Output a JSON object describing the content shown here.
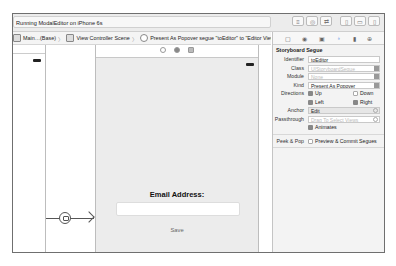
{
  "toolbar": {
    "run_status": "Running ModalEditor on iPhone 6s",
    "icons": [
      "editor-standard-icon",
      "assistant-editor-icon",
      "version-editor-icon",
      "navigator-toggle-icon",
      "debug-area-toggle-icon",
      "utilities-toggle-icon"
    ]
  },
  "jumpbar": {
    "items": [
      {
        "label": "Main…(Base)",
        "icon": "storyboard-file-icon"
      },
      {
        "label": "View Controller Scene",
        "icon": "scene-icon"
      },
      {
        "label": "Present As Popover segue \"toEditor\" to \"Editor View Controller\"",
        "icon": "segue-icon"
      }
    ]
  },
  "canvas": {
    "view_controller": {
      "email_label": "Email Address:",
      "email_field_value": "",
      "save_button": "Save"
    }
  },
  "inspector": {
    "tabs": [
      "file-inspector",
      "quick-help",
      "identity-inspector",
      "attributes-inspector",
      "size-inspector",
      "connections-inspector"
    ],
    "section_title": "Storyboard Segue",
    "identifier_label": "Identifier",
    "identifier_value": "toEditor",
    "class_label": "Class",
    "class_placeholder": "UIStoryboardSegue",
    "module_label": "Module",
    "module_placeholder": "None",
    "kind_label": "Kind",
    "kind_value": "Present As Popover",
    "directions_label": "Directions",
    "directions": {
      "up": "Up",
      "down": "Down",
      "left": "Left",
      "right": "Right"
    },
    "anchor_label": "Anchor",
    "anchor_value": "Edit",
    "passthrough_label": "Passthrough",
    "passthrough_placeholder": "Drag To Select Views",
    "animates_label": "Animates",
    "peek_label": "Peek & Pop",
    "peek_option": "Preview & Commit Segues"
  }
}
